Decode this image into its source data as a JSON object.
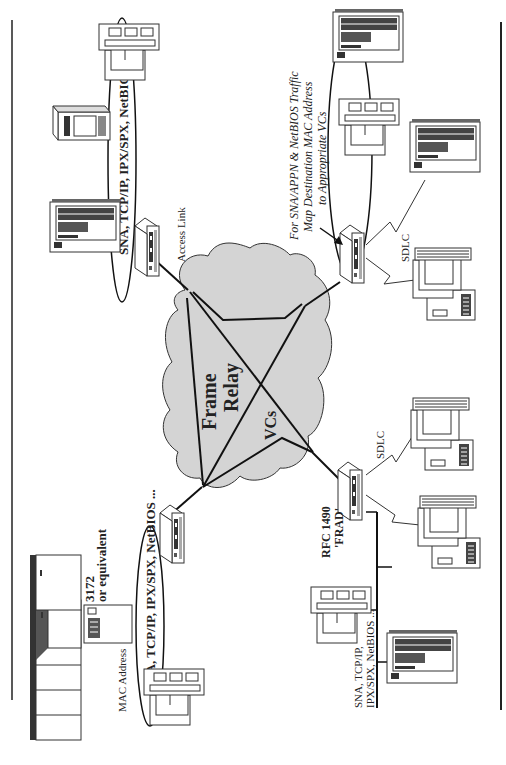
{
  "diagram": {
    "cloud": {
      "label_line1": "Frame",
      "label_line2": "Relay",
      "vcs_label": "VCs",
      "fill": "#d4d4d4"
    },
    "labels": {
      "access_link": "Access Link",
      "top_lan_protocols": "SNA, TCP/IP, IPX/SPX, NetBIOS ...",
      "bottom_lan_protocols": "SNA, TCP/IP, IPX/SPX, NetBIOS ...",
      "mac_address": "MAC Address",
      "controller_line1": "3172",
      "controller_line2": "or equivalent",
      "frad_line1": "RFC 1490",
      "frad_line2": "'FRAD'",
      "sdlc_right_top": "SDLC",
      "sdlc_right_bottom": "SDLC",
      "note_line1": "For SNA/APPN & NetBIOS Traffic",
      "note_line2": "Map Destination MAC Address",
      "note_line3": "to Appropriate VCs",
      "bus_lan_line1": "SNA, TCP/IP,",
      "bus_lan_line2": "IPX/SPX, NetBIOS ..."
    },
    "nodes": [
      {
        "id": "router-top-left",
        "type": "router"
      },
      {
        "id": "router-bottom-left",
        "type": "router"
      },
      {
        "id": "frad-top-right",
        "type": "frad"
      },
      {
        "id": "frad-bottom-right",
        "type": "frad"
      },
      {
        "id": "mainframe",
        "type": "mainframe"
      },
      {
        "id": "controller-3172",
        "type": "controller"
      },
      {
        "id": "server-tower-1",
        "type": "server"
      },
      {
        "id": "server-tower-2",
        "type": "server"
      },
      {
        "id": "server-tower-3",
        "type": "server"
      },
      {
        "id": "server-tower-4",
        "type": "server"
      },
      {
        "id": "server-tower-5",
        "type": "server"
      },
      {
        "id": "workstation-1",
        "type": "workstation"
      },
      {
        "id": "workstation-2",
        "type": "workstation"
      },
      {
        "id": "workstation-3",
        "type": "workstation"
      },
      {
        "id": "workstation-4",
        "type": "workstation"
      },
      {
        "id": "terminal-1",
        "type": "terminal"
      },
      {
        "id": "terminal-2",
        "type": "terminal"
      },
      {
        "id": "terminal-3",
        "type": "terminal"
      }
    ]
  }
}
